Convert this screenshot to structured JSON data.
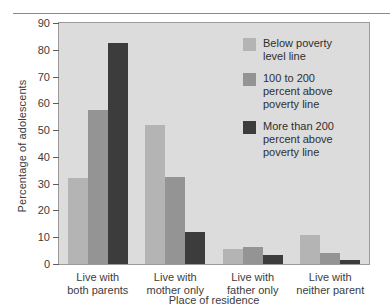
{
  "chart_data": {
    "type": "bar",
    "title": "",
    "xlabel": "Place of residence",
    "ylabel": "Percentage of adolescents",
    "ylim": [
      0,
      90
    ],
    "ytick_step": 10,
    "yticks": [
      0,
      10,
      20,
      30,
      40,
      50,
      60,
      70,
      80,
      90
    ],
    "ytick_labels": [
      "0",
      "10",
      "20",
      "30",
      "40",
      "50",
      "60",
      "70",
      "80",
      "90"
    ],
    "grid": false,
    "legend_position": "upper right",
    "categories": [
      "Live with\nboth parents",
      "Live with\nmother only",
      "Live with\nfather only",
      "Live with\nneither parent"
    ],
    "category_labels": [
      [
        "Live with",
        "both parents"
      ],
      [
        "Live with",
        "mother only"
      ],
      [
        "Live with",
        "father only"
      ],
      [
        "Live with",
        "neither parent"
      ]
    ],
    "series": [
      {
        "name": "Below poverty level line",
        "color": "#b4b4b4",
        "values": [
          32,
          52,
          5.5,
          11
        ]
      },
      {
        "name": "100 to 200 percent above poverty line",
        "color": "#949494",
        "values": [
          57.5,
          32.5,
          6.5,
          4
        ]
      },
      {
        "name": "More than 200 percent above poverty line",
        "color": "#3c3c3c",
        "values": [
          82.5,
          12,
          3.5,
          1.5
        ]
      }
    ]
  },
  "legend": {
    "entries": [
      {
        "lines": [
          "Below poverty",
          "level line"
        ]
      },
      {
        "lines": [
          "100 to 200",
          "percent above",
          "poverty line"
        ]
      },
      {
        "lines": [
          "More than 200",
          "percent above",
          "poverty line"
        ]
      }
    ]
  },
  "style": {
    "plot_background": "#dcdcdc",
    "plot_border": "#9a9a9a",
    "axis_color": "#5d5d5d",
    "text_color": "#3c3c3c",
    "page_background": "#ffffff"
  }
}
